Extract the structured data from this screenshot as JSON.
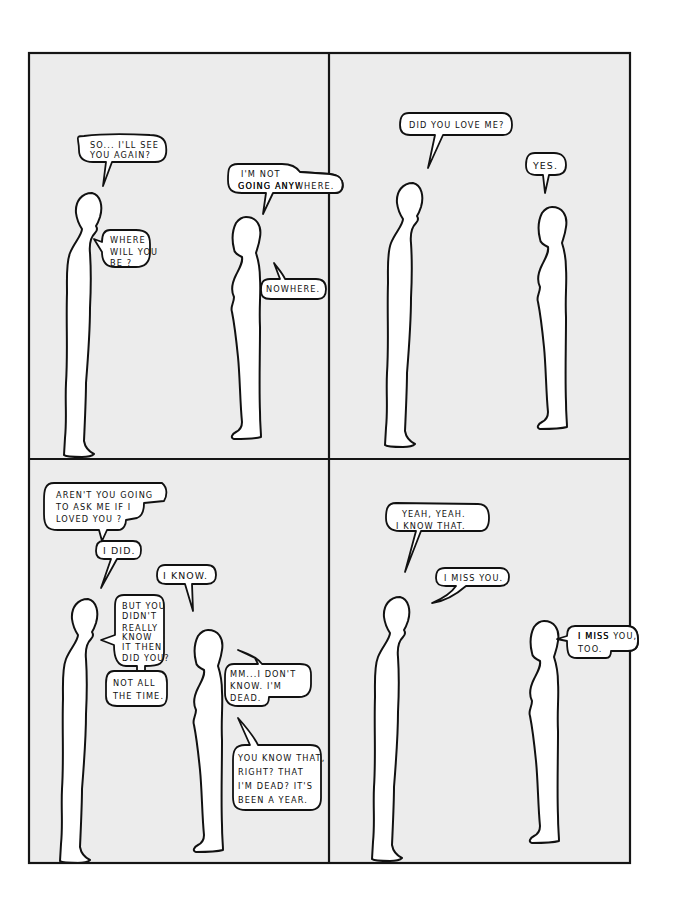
{
  "comic": {
    "colors": {
      "panel_background": "#ececec",
      "page_background": "#ffffff",
      "ink": "#111111",
      "figure_fill": "#ffffff"
    },
    "panels": [
      {
        "id": 1,
        "bubbles": [
          {
            "speaker": "left",
            "lines": [
              "SO... I'LL SEE",
              "YOU AGAIN?"
            ]
          },
          {
            "speaker": "right",
            "lines": [
              "I'M NOT",
              "GOING ANYWHERE."
            ]
          },
          {
            "speaker": "left",
            "lines": [
              "WHERE",
              "WILL YOU",
              "BE ?"
            ]
          },
          {
            "speaker": "right",
            "lines": [
              "NOWHERE."
            ]
          }
        ]
      },
      {
        "id": 2,
        "bubbles": [
          {
            "speaker": "left",
            "lines": [
              "DID YOU LOVE ME?"
            ]
          },
          {
            "speaker": "right",
            "lines": [
              "YES."
            ]
          }
        ]
      },
      {
        "id": 3,
        "bubbles": [
          {
            "speaker": "right",
            "lines": [
              "AREN'T  YOU GOING",
              "TO ASK ME IF I",
              "LOVED YOU ?"
            ]
          },
          {
            "speaker": "left",
            "lines": [
              "I DID."
            ]
          },
          {
            "speaker": "right",
            "lines": [
              "I KNOW."
            ]
          },
          {
            "speaker": "left",
            "lines": [
              "BUT YOU",
              "DIDN'T",
              "REALLY",
              "KNOW",
              "IT THEN",
              "DID YOU?"
            ]
          },
          {
            "speaker": "left",
            "lines": [
              "NOT ALL",
              "THE TIME."
            ]
          },
          {
            "speaker": "right",
            "lines": [
              "MM...I DON'T",
              "KNOW.  I'M",
              "DEAD."
            ]
          },
          {
            "speaker": "right",
            "lines": [
              "YOU KNOW THAT,",
              "RIGHT?  THAT",
              "I'M DEAD?  IT'S",
              "BEEN  A  YEAR."
            ]
          }
        ]
      },
      {
        "id": 4,
        "bubbles": [
          {
            "speaker": "left",
            "lines": [
              "YEAH, YEAH.",
              "I KNOW THAT."
            ]
          },
          {
            "speaker": "left",
            "lines": [
              "I MISS YOU."
            ]
          },
          {
            "speaker": "right",
            "lines": [
              "I MISS YOU,",
              "TOO."
            ]
          }
        ]
      }
    ]
  }
}
